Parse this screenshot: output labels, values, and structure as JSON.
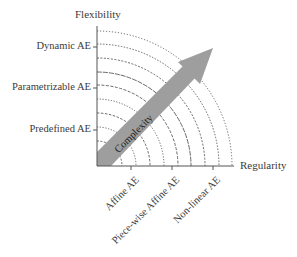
{
  "diagram": {
    "y_axis": {
      "title": "Flexibility",
      "ticks": [
        {
          "label": "Dynamic AE"
        },
        {
          "label": "Parametrizable AE"
        },
        {
          "label": "Predefined AE"
        }
      ]
    },
    "x_axis": {
      "title": "Regularity",
      "ticks": [
        {
          "label": "Affine AE"
        },
        {
          "label": "Piece-wise Affine AE"
        },
        {
          "label": "Non-linear AE"
        }
      ]
    },
    "arrow": {
      "label": "Complexity",
      "color": "#9e9e9e"
    },
    "colors": {
      "axis": "#555555",
      "arcs": "#444444"
    }
  }
}
